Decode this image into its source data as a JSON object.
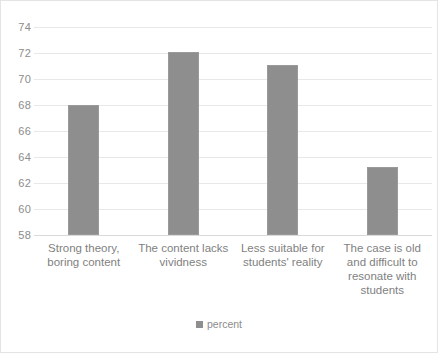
{
  "chart_data": {
    "type": "bar",
    "title": "",
    "subtitle": "",
    "xlabel": "",
    "ylabel": "",
    "categories": [
      "Strong theory, boring content",
      "The content lacks vividness",
      "Less suitable for students' reality",
      "The case is old and difficult to resonate with students"
    ],
    "series": [
      {
        "name": "percent",
        "values": [
          68.0,
          72.1,
          71.1,
          63.2
        ],
        "color": "#8e8e8e"
      }
    ],
    "ylim": [
      58,
      74
    ],
    "ytick_labels": [
      "58",
      "60",
      "62",
      "64",
      "66",
      "68",
      "70",
      "72",
      "74"
    ],
    "ytick_values": [
      58,
      60,
      62,
      64,
      66,
      68,
      70,
      72,
      74
    ],
    "grid": true,
    "legend": {
      "position": "bottom",
      "entries": [
        {
          "label": "percent",
          "marker": "square-swatch",
          "color": "#8e8e8e"
        }
      ]
    }
  },
  "colors": {
    "bar_fill": "#8e8e8e",
    "gridline": "#e8e8e8",
    "axis_text": "#8c8c8c",
    "category_text": "#7f7f7f",
    "frame_border": "#e4e4e4"
  }
}
